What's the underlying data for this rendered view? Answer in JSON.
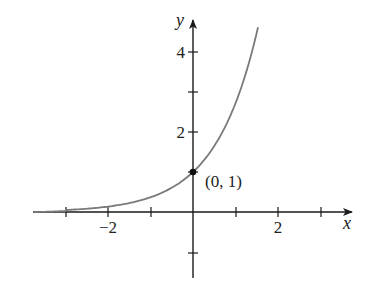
{
  "chart_data": {
    "type": "line",
    "title": "",
    "function": "y = e^x",
    "xlabel": "x",
    "ylabel": "y",
    "xlim": [
      -3.75,
      3.7
    ],
    "ylim": [
      -1.6,
      4.7
    ],
    "grid": false,
    "legend": null,
    "x_ticks": [
      -3,
      -2,
      -1,
      1,
      2,
      3
    ],
    "x_tick_labels": [
      {
        "value": -2,
        "label": "−2"
      },
      {
        "value": 2,
        "label": "2"
      }
    ],
    "y_ticks": [
      -1,
      1,
      2,
      3,
      4
    ],
    "y_tick_labels": [
      {
        "value": 2,
        "label": "2"
      },
      {
        "value": 4,
        "label": "4"
      }
    ],
    "series": [
      {
        "name": "e^x",
        "color": "#7a7a7a",
        "x": [
          -3.75,
          -3,
          -2.5,
          -2,
          -1.5,
          -1,
          -0.5,
          0,
          0.5,
          1,
          1.25,
          1.5,
          1.53
        ],
        "y": [
          0.024,
          0.05,
          0.082,
          0.135,
          0.223,
          0.368,
          0.607,
          1.0,
          1.649,
          2.718,
          3.49,
          4.48,
          4.62
        ]
      }
    ],
    "annotations": [
      {
        "x": 0,
        "y": 1,
        "label": "(0, 1)",
        "marker": "filled-circle"
      }
    ]
  },
  "labels": {
    "x_axis": "x",
    "y_axis": "y",
    "x_tick_neg2": "−2",
    "x_tick_2": "2",
    "y_tick_2": "2",
    "y_tick_4": "4",
    "point": "(0, 1)"
  },
  "colors": {
    "axis": "#1a1a1a",
    "curve": "#7a7a7a",
    "text": "#222222"
  }
}
